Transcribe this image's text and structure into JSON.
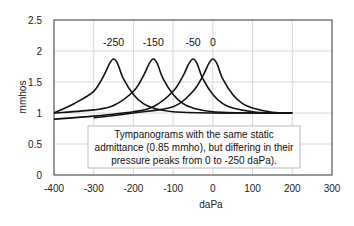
{
  "chart_data": {
    "type": "line",
    "title": "",
    "xlabel": "daPa",
    "ylabel": "mmhos",
    "xlim": [
      -400,
      300
    ],
    "ylim": [
      0,
      2.5
    ],
    "xticks": [
      -400,
      -300,
      -200,
      -100,
      0,
      100,
      200,
      300
    ],
    "yticks": [
      0,
      0.5,
      1,
      1.5,
      2,
      2.5
    ],
    "ytick_labels": [
      "0",
      "0.5",
      "1",
      "1.5",
      "2",
      "2.5"
    ],
    "grid": true,
    "legend": null,
    "series": [
      {
        "name": "-250",
        "x": [
          -400,
          -350,
          -300,
          -275,
          -260,
          -250,
          -240,
          -225,
          -200,
          -175,
          -150,
          -100,
          0,
          100,
          200
        ],
        "y": [
          1.0,
          1.15,
          1.35,
          1.6,
          1.8,
          1.87,
          1.8,
          1.55,
          1.3,
          1.15,
          1.08,
          1.02,
          1.0,
          1.0,
          1.0
        ]
      },
      {
        "name": "-150",
        "x": [
          -400,
          -300,
          -250,
          -200,
          -175,
          -160,
          -150,
          -140,
          -125,
          -100,
          -75,
          -50,
          0,
          100,
          200
        ],
        "y": [
          1.0,
          1.05,
          1.12,
          1.35,
          1.6,
          1.8,
          1.87,
          1.8,
          1.55,
          1.3,
          1.15,
          1.08,
          1.02,
          1.0,
          1.0
        ]
      },
      {
        "name": "-50",
        "x": [
          -400,
          -300,
          -200,
          -150,
          -100,
          -75,
          -60,
          -50,
          -40,
          -25,
          0,
          25,
          50,
          100,
          150,
          200
        ],
        "y": [
          0.9,
          0.95,
          1.02,
          1.1,
          1.35,
          1.6,
          1.8,
          1.87,
          1.8,
          1.55,
          1.3,
          1.15,
          1.08,
          1.02,
          1.0,
          1.0
        ]
      },
      {
        "name": "0",
        "x": [
          -300,
          -200,
          -100,
          -50,
          -25,
          -10,
          0,
          10,
          25,
          50,
          75,
          100,
          150,
          200
        ],
        "y": [
          0.92,
          1.0,
          1.1,
          1.35,
          1.6,
          1.8,
          1.87,
          1.8,
          1.55,
          1.3,
          1.15,
          1.08,
          1.01,
          1.0
        ]
      }
    ],
    "annotations": [
      {
        "text": "-250",
        "x": -250,
        "y": 2.15
      },
      {
        "text": "-150",
        "x": -150,
        "y": 2.15
      },
      {
        "text": "-50",
        "x": -50,
        "y": 2.15
      },
      {
        "text": "0",
        "x": 0,
        "y": 2.15
      }
    ],
    "note": [
      "Tympanograms with the same static",
      "admittance (0.85 mmho), but differing in their",
      "pressure peaks from 0 to -250 daPa)."
    ]
  }
}
